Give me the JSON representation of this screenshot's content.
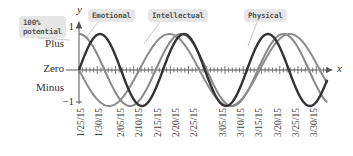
{
  "chart_data": {
    "type": "line",
    "title": "",
    "xlabel": "x",
    "ylabel": "y",
    "ylim": [
      -1,
      1
    ],
    "x_tick_labels": [
      "1/25/15",
      "1/30/15",
      "2/05/15",
      "2/10/15",
      "2/15/15",
      "2/20/15",
      "2/25/15",
      "3/05/15",
      "3/10/15",
      "3/15/15",
      "3/20/15",
      "3/25/15",
      "3/30/15"
    ],
    "y_tick_labels": [
      "1",
      "-1"
    ],
    "y_region_labels": [
      "Plus",
      "Zero",
      "Minus"
    ],
    "annotations": [
      "100% potential",
      "Emotional",
      "Intellectual",
      "Physical"
    ],
    "series": [
      {
        "name": "Physical",
        "period_days": 23,
        "phase": "sin",
        "color": "#333333"
      },
      {
        "name": "Emotional",
        "period_days": 28,
        "phase": "cos",
        "color": "#888888"
      },
      {
        "name": "Intellectual",
        "period_days": 33,
        "phase": "-sin",
        "color": "#8c8c8c"
      }
    ],
    "grid": false
  },
  "labels": {
    "potential_1": "100%",
    "potential_2": "potential",
    "emotional": "Emotional",
    "intellectual": "Intellectual",
    "physical": "Physical",
    "plus": "Plus",
    "zero": "Zero",
    "minus": "Minus",
    "y_one": "1",
    "y_neg_one": "−1",
    "y_axis": "y",
    "x_axis": "x"
  }
}
